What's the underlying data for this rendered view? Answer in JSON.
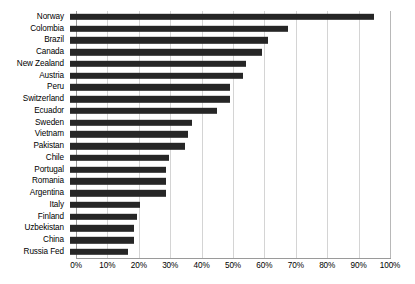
{
  "chart_data": {
    "type": "bar",
    "orientation": "horizontal",
    "title": "",
    "xlabel": "",
    "ylabel": "",
    "xlim": [
      0,
      100
    ],
    "xtick_labels": [
      "0%",
      "10%",
      "20%",
      "30%",
      "40%",
      "50%",
      "60%",
      "70%",
      "80%",
      "90%",
      "100%"
    ],
    "xtick_values": [
      0,
      10,
      20,
      30,
      40,
      50,
      60,
      70,
      80,
      90,
      100
    ],
    "grid": true,
    "legend": "none",
    "bar_color": "#262626",
    "gridline_color": "#d4d4d4",
    "axis_color": "#9a9a9a",
    "background_color": "#ffffff",
    "categories": [
      "Norway",
      "Colombia",
      "Brazil",
      "Canada",
      "New Zealand",
      "Austria",
      "Peru",
      "Switzerland",
      "Ecuador",
      "Sweden",
      "Vietnam",
      "Pakistan",
      "Chile",
      "Portugal",
      "Romania",
      "Argentina",
      "Italy",
      "Finland",
      "Uzbekistan",
      "China",
      "Russia Fed"
    ],
    "values": [
      95,
      68,
      62,
      60,
      55,
      54,
      50,
      50,
      46,
      38,
      37,
      36,
      31,
      30,
      30,
      30,
      22,
      21,
      20,
      20,
      18
    ]
  }
}
